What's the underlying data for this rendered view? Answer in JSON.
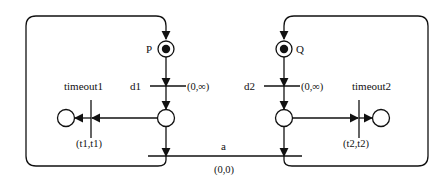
{
  "diagram": {
    "type": "petri-net",
    "places": [
      {
        "id": "P",
        "label": "P",
        "marked": true
      },
      {
        "id": "Q",
        "label": "Q",
        "marked": true
      },
      {
        "id": "p1_mid",
        "label": "",
        "marked": false
      },
      {
        "id": "p2_mid",
        "label": "",
        "marked": false
      },
      {
        "id": "p1_end",
        "label": "",
        "marked": false
      },
      {
        "id": "p2_end",
        "label": "",
        "marked": false
      }
    ],
    "transitions": [
      {
        "id": "d1",
        "label": "d1",
        "interval": "(0,∞)"
      },
      {
        "id": "d2",
        "label": "d2",
        "interval": "(0,∞)"
      },
      {
        "id": "timeout1",
        "label": "timeout1",
        "interval": "(t1,t1)"
      },
      {
        "id": "timeout2",
        "label": "timeout2",
        "interval": "(t2,t2)"
      },
      {
        "id": "a",
        "label": "a",
        "interval": "(0,0)"
      }
    ],
    "colors": {
      "stroke": "#111111",
      "background": "#ffffff"
    }
  }
}
